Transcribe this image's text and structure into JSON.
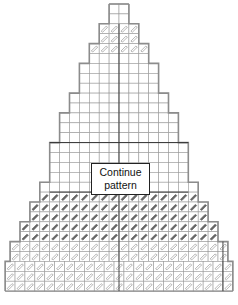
{
  "diagram": {
    "type": "stitch-chart",
    "cell_size": 9.9,
    "grid_color": "#9a9a9a",
    "outline_color": "#8c8c8c",
    "axis_color": "#333333",
    "stitch_dark_color": "#666666",
    "stitch_light_color": "#9a9a9a",
    "label": {
      "line1": "Continue",
      "line2": "pattern"
    },
    "caption": "▬▬▬▬  ▬▬▬ ▬▬▬▬▬▬▬  ▬"
  }
}
